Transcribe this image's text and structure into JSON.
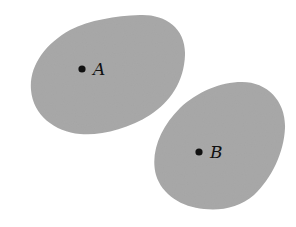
{
  "figure": {
    "background": "#ffffff",
    "region_color": "#a9a9a9",
    "point_color": "#111111",
    "regions": [
      {
        "id": "A",
        "point": {
          "x": 82,
          "y": 69,
          "r": 3.6
        },
        "label": "A",
        "label_pos": {
          "x": 93,
          "y": 75
        }
      },
      {
        "id": "B",
        "point": {
          "x": 199,
          "y": 152,
          "r": 3.6
        },
        "label": "B",
        "label_pos": {
          "x": 210,
          "y": 158
        }
      }
    ]
  }
}
